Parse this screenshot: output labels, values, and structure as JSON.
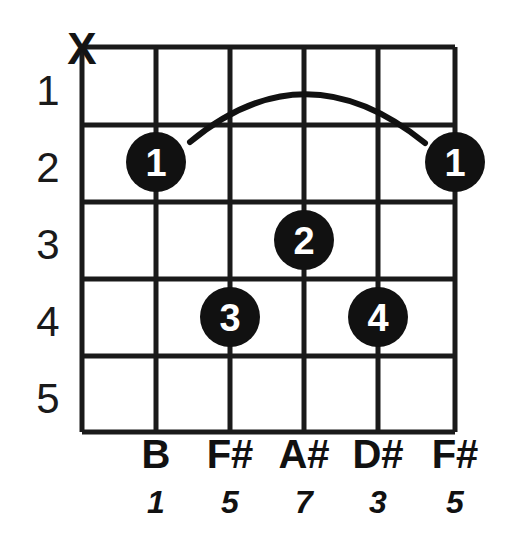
{
  "diagram": {
    "type": "guitar-chord-diagram",
    "colors": {
      "ink": "#111111",
      "grid": "#1a1a1a",
      "dot_fill": "#111111",
      "dot_label": "#ffffff",
      "background": "#ffffff"
    },
    "geometry": {
      "grid_left": 82,
      "grid_right": 455,
      "grid_top": 47,
      "grid_bottom": 432,
      "string_x": [
        82,
        156,
        230,
        304,
        378,
        455
      ],
      "fret_y": [
        47,
        125,
        202,
        279,
        356,
        432
      ],
      "dot_radius": 30
    },
    "fret_numbers": [
      {
        "label": "1",
        "x": 48,
        "y": 105
      },
      {
        "label": "2",
        "x": 48,
        "y": 182
      },
      {
        "label": "3",
        "x": 48,
        "y": 259
      },
      {
        "label": "4",
        "x": 48,
        "y": 336
      },
      {
        "label": "5",
        "x": 48,
        "y": 413
      }
    ],
    "string_markers": [
      {
        "string": 1,
        "symbol": "X",
        "meaning": "muted",
        "x": 82,
        "y": 64
      }
    ],
    "barre": {
      "finger": "1",
      "fret": 2,
      "from_string": 2,
      "to_string": 6,
      "start_x": 190,
      "start_y": 142,
      "peak_x": 305,
      "peak_y": 84,
      "end_x": 425,
      "end_y": 143
    },
    "finger_dots": [
      {
        "finger": "1",
        "string": 2,
        "fret": 2,
        "cx": 156,
        "cy": 162
      },
      {
        "finger": "1",
        "string": 6,
        "fret": 2,
        "cx": 455,
        "cy": 162
      },
      {
        "finger": "2",
        "string": 4,
        "fret": 3,
        "cx": 304,
        "cy": 240
      },
      {
        "finger": "3",
        "string": 3,
        "fret": 4,
        "cx": 230,
        "cy": 317
      },
      {
        "finger": "4",
        "string": 5,
        "fret": 4,
        "cx": 378,
        "cy": 317
      }
    ],
    "note_names": [
      {
        "label": "B",
        "x": 156,
        "y": 468
      },
      {
        "label": "F#",
        "x": 230,
        "y": 468
      },
      {
        "label": "A#",
        "x": 304,
        "y": 468
      },
      {
        "label": "D#",
        "x": 378,
        "y": 468
      },
      {
        "label": "F#",
        "x": 455,
        "y": 468
      }
    ],
    "intervals": [
      {
        "label": "1",
        "x": 156,
        "y": 513
      },
      {
        "label": "5",
        "x": 230,
        "y": 513
      },
      {
        "label": "7",
        "x": 304,
        "y": 513
      },
      {
        "label": "3",
        "x": 378,
        "y": 513
      },
      {
        "label": "5",
        "x": 455,
        "y": 513
      }
    ]
  }
}
